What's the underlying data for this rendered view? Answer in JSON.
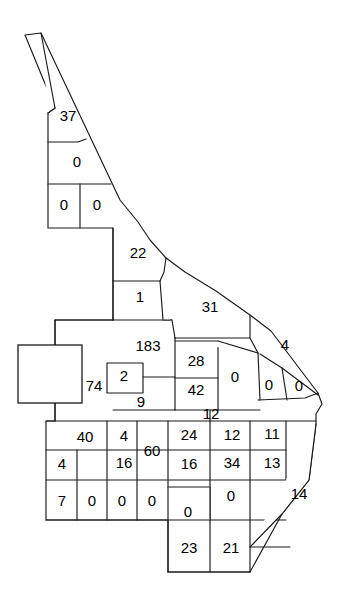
{
  "figure": {
    "type": "choropleth-region-map",
    "background_color": "#ffffff",
    "outline_color": "#1a1a1a",
    "label_color": "#000000",
    "texture_color": "#c9c9c9",
    "width": 362,
    "height": 605
  },
  "regions": [
    {
      "id": "r-37",
      "label": "37",
      "x": 68,
      "y": 117
    },
    {
      "id": "r-0a",
      "label": "0",
      "x": 77,
      "y": 163
    },
    {
      "id": "r-0b",
      "label": "0",
      "x": 64,
      "y": 206
    },
    {
      "id": "r-0c",
      "label": "0",
      "x": 97,
      "y": 206
    },
    {
      "id": "r-22",
      "label": "22",
      "x": 138,
      "y": 254
    },
    {
      "id": "r-1",
      "label": "1",
      "x": 140,
      "y": 298
    },
    {
      "id": "r-31",
      "label": "31",
      "x": 210,
      "y": 308
    },
    {
      "id": "r-183",
      "label": "183",
      "x": 148,
      "y": 347
    },
    {
      "id": "r-4r",
      "label": "4",
      "x": 285,
      "y": 346
    },
    {
      "id": "r-28",
      "label": "28",
      "x": 196,
      "y": 362
    },
    {
      "id": "r-0d",
      "label": "0",
      "x": 235,
      "y": 378
    },
    {
      "id": "r-74",
      "label": "74",
      "x": 94,
      "y": 387
    },
    {
      "id": "r-2",
      "label": "2",
      "x": 124,
      "y": 377
    },
    {
      "id": "r-42",
      "label": "42",
      "x": 196,
      "y": 391
    },
    {
      "id": "r-0e",
      "label": "0",
      "x": 269,
      "y": 386
    },
    {
      "id": "r-0f",
      "label": "0",
      "x": 299,
      "y": 387
    },
    {
      "id": "r-9",
      "label": "9",
      "x": 141,
      "y": 403
    },
    {
      "id": "r-12a",
      "label": "12",
      "x": 211,
      "y": 415
    },
    {
      "id": "r-40",
      "label": "40",
      "x": 85,
      "y": 438
    },
    {
      "id": "r-4a",
      "label": "4",
      "x": 124,
      "y": 437
    },
    {
      "id": "r-24",
      "label": "24",
      "x": 189,
      "y": 436
    },
    {
      "id": "r-12b",
      "label": "12",
      "x": 232,
      "y": 436
    },
    {
      "id": "r-11",
      "label": "11",
      "x": 272,
      "y": 435
    },
    {
      "id": "r-60",
      "label": "60",
      "x": 152,
      "y": 452
    },
    {
      "id": "r-4b",
      "label": "4",
      "x": 62,
      "y": 465
    },
    {
      "id": "r-16a",
      "label": "16",
      "x": 124,
      "y": 464
    },
    {
      "id": "r-16b",
      "label": "16",
      "x": 189,
      "y": 465
    },
    {
      "id": "r-34",
      "label": "34",
      "x": 232,
      "y": 464
    },
    {
      "id": "r-13",
      "label": "13",
      "x": 272,
      "y": 464
    },
    {
      "id": "r-7",
      "label": "7",
      "x": 62,
      "y": 502
    },
    {
      "id": "r-0g",
      "label": "0",
      "x": 92,
      "y": 502
    },
    {
      "id": "r-0h",
      "label": "0",
      "x": 122,
      "y": 502
    },
    {
      "id": "r-0i",
      "label": "0",
      "x": 152,
      "y": 502
    },
    {
      "id": "r-0j",
      "label": "0",
      "x": 188,
      "y": 513
    },
    {
      "id": "r-0k",
      "label": "0",
      "x": 231,
      "y": 497
    },
    {
      "id": "r-14",
      "label": "14",
      "x": 299,
      "y": 495
    },
    {
      "id": "r-23",
      "label": "23",
      "x": 189,
      "y": 549
    },
    {
      "id": "r-21",
      "label": "21",
      "x": 231,
      "y": 549
    }
  ],
  "region_outlines": [
    {
      "id": "o-sliver",
      "d": "M 25 35 L 41 33 L 55 108 L 48 113 Z"
    },
    {
      "id": "o-37",
      "d": "M 48 113 L 87 113 L 86 139 L 78 142 L 55 142 L 55 108 Z"
    },
    {
      "id": "o-0a",
      "d": "M 55 142 L 78 142 L 86 139 L 111 184 L 48 184 L 48 142 Z"
    },
    {
      "id": "o-0b",
      "d": "M 48 184 L 80 184 L 80 228 L 48 228 Z"
    },
    {
      "id": "o-0c",
      "d": "M 80 184 L 111 184 L 114 188 L 113 228 L 80 228 Z"
    },
    {
      "id": "o-22",
      "d": "M 113 228 L 114 188 L 130 213 L 152 243 L 165 257 L 164 272 L 160 281 L 113 281 Z"
    },
    {
      "id": "o-1",
      "d": "M 113 281 L 160 281 L 163 320 L 113 320 Z"
    },
    {
      "id": "o-31",
      "d": "M 163 320 L 160 281 L 164 272 L 172 262 L 250 315 L 250 338 L 175 338 L 172 320 Z"
    },
    {
      "id": "o-4right",
      "d": "M 250 315 L 271 331 L 318 393 L 305 396 L 260 396 L 258 353 L 250 338 Z"
    },
    {
      "id": "o-183",
      "d": "M 113 320 L 172 320 L 175 338 L 175 410 L 113 410 Z"
    },
    {
      "id": "o-74",
      "d": "M 55 320 L 113 320 L 113 410 L 55 410 Z"
    },
    {
      "id": "o-2box",
      "d": "M 107 363 L 143 363 L 143 393 L 107 393 Z"
    },
    {
      "id": "o-28",
      "d": "M 175 338 L 218 341 L 218 378 L 175 378 Z"
    },
    {
      "id": "o-42",
      "d": "M 175 378 L 218 378 L 218 410 L 175 410 Z"
    },
    {
      "id": "o-0d",
      "d": "M 218 341 L 258 353 L 260 396 L 218 410 Z"
    },
    {
      "id": "o-0e",
      "d": "M 260 353 L 282 368 L 287 400 L 258 400 Z"
    },
    {
      "id": "o-0f",
      "d": "M 282 368 L 318 395 L 287 400 Z"
    },
    {
      "id": "o-grid1",
      "d": "M 46 421 L 316 421"
    },
    {
      "id": "o-grid2",
      "d": "M 46 450 L 316 450"
    },
    {
      "id": "o-grid3",
      "d": "M 46 480 L 316 480"
    },
    {
      "id": "o-grid4",
      "d": "M 46 520 L 310 520"
    },
    {
      "id": "o-grid5",
      "d": "M 168 572 L 250 572"
    },
    {
      "id": "o-left",
      "d": "M 46 421 L 46 520"
    }
  ],
  "texture_patches": [
    {
      "x": 55,
      "y": 321,
      "w": 4,
      "h": 5
    },
    {
      "x": 62,
      "y": 322,
      "w": 2,
      "h": 6
    },
    {
      "x": 83,
      "y": 322,
      "w": 3,
      "h": 3
    },
    {
      "x": 90,
      "y": 320,
      "w": 2,
      "h": 8
    },
    {
      "x": 96,
      "y": 323,
      "w": 4,
      "h": 3
    },
    {
      "x": 55,
      "y": 334,
      "w": 8,
      "h": 3
    },
    {
      "x": 66,
      "y": 335,
      "w": 3,
      "h": 3
    },
    {
      "x": 74,
      "y": 334,
      "w": 2,
      "h": 4
    },
    {
      "x": 80,
      "y": 333,
      "w": 3,
      "h": 5
    },
    {
      "x": 86,
      "y": 336,
      "w": 5,
      "h": 2
    },
    {
      "x": 128,
      "y": 322,
      "w": 6,
      "h": 4
    },
    {
      "x": 137,
      "y": 321,
      "w": 3,
      "h": 6
    },
    {
      "x": 146,
      "y": 324,
      "w": 4,
      "h": 3
    },
    {
      "x": 130,
      "y": 330,
      "w": 7,
      "h": 5
    },
    {
      "x": 140,
      "y": 331,
      "w": 14,
      "h": 6
    },
    {
      "x": 156,
      "y": 333,
      "w": 8,
      "h": 4
    },
    {
      "x": 166,
      "y": 330,
      "w": 5,
      "h": 7
    },
    {
      "x": 122,
      "y": 371,
      "w": 12,
      "h": 4
    },
    {
      "x": 122,
      "y": 375,
      "w": 3,
      "h": 7
    },
    {
      "x": 146,
      "y": 345,
      "w": 3,
      "h": 4
    },
    {
      "x": 154,
      "y": 352,
      "w": 5,
      "h": 3
    },
    {
      "x": 146,
      "y": 362,
      "w": 4,
      "h": 3
    },
    {
      "x": 158,
      "y": 366,
      "w": 5,
      "h": 4
    },
    {
      "x": 148,
      "y": 374,
      "w": 3,
      "h": 5
    },
    {
      "x": 160,
      "y": 379,
      "w": 7,
      "h": 5
    },
    {
      "x": 165,
      "y": 386,
      "w": 5,
      "h": 6
    },
    {
      "x": 172,
      "y": 390,
      "w": 4,
      "h": 4
    },
    {
      "x": 178,
      "y": 380,
      "w": 8,
      "h": 6
    },
    {
      "x": 180,
      "y": 392,
      "w": 5,
      "h": 4
    },
    {
      "x": 188,
      "y": 346,
      "w": 6,
      "h": 4
    },
    {
      "x": 198,
      "y": 343,
      "w": 4,
      "h": 5
    },
    {
      "x": 206,
      "y": 347,
      "w": 7,
      "h": 4
    },
    {
      "x": 180,
      "y": 355,
      "w": 4,
      "h": 3
    },
    {
      "x": 186,
      "y": 368,
      "w": 3,
      "h": 4
    },
    {
      "x": 192,
      "y": 372,
      "w": 5,
      "h": 3
    },
    {
      "x": 176,
      "y": 400,
      "w": 12,
      "h": 3
    },
    {
      "x": 176,
      "y": 406,
      "w": 6,
      "h": 3
    },
    {
      "x": 192,
      "y": 404,
      "w": 7,
      "h": 3
    },
    {
      "x": 222,
      "y": 398,
      "w": 5,
      "h": 3
    },
    {
      "x": 238,
      "y": 400,
      "w": 6,
      "h": 3
    },
    {
      "x": 262,
      "y": 402,
      "w": 5,
      "h": 3
    },
    {
      "x": 278,
      "y": 403,
      "w": 7,
      "h": 3
    },
    {
      "x": 48,
      "y": 423,
      "w": 6,
      "h": 3
    },
    {
      "x": 56,
      "y": 430,
      "w": 3,
      "h": 3
    },
    {
      "x": 57,
      "y": 451,
      "w": 4,
      "h": 3
    },
    {
      "x": 74,
      "y": 456,
      "w": 3,
      "h": 3
    },
    {
      "x": 84,
      "y": 472,
      "w": 9,
      "h": 4
    },
    {
      "x": 96,
      "y": 470,
      "w": 6,
      "h": 5
    },
    {
      "x": 104,
      "y": 423,
      "w": 3,
      "h": 4
    },
    {
      "x": 106,
      "y": 443,
      "w": 4,
      "h": 3
    },
    {
      "x": 132,
      "y": 432,
      "w": 3,
      "h": 3
    },
    {
      "x": 138,
      "y": 424,
      "w": 5,
      "h": 4
    },
    {
      "x": 144,
      "y": 435,
      "w": 4,
      "h": 5
    },
    {
      "x": 142,
      "y": 460,
      "w": 3,
      "h": 4
    },
    {
      "x": 156,
      "y": 466,
      "w": 5,
      "h": 3
    },
    {
      "x": 160,
      "y": 425,
      "w": 4,
      "h": 4
    },
    {
      "x": 168,
      "y": 424,
      "w": 3,
      "h": 4
    },
    {
      "x": 172,
      "y": 432,
      "w": 5,
      "h": 3
    },
    {
      "x": 176,
      "y": 440,
      "w": 3,
      "h": 3
    },
    {
      "x": 196,
      "y": 425,
      "w": 4,
      "h": 3
    },
    {
      "x": 206,
      "y": 423,
      "w": 3,
      "h": 5
    },
    {
      "x": 212,
      "y": 428,
      "w": 5,
      "h": 3
    },
    {
      "x": 220,
      "y": 452,
      "w": 4,
      "h": 5
    },
    {
      "x": 236,
      "y": 452,
      "w": 8,
      "h": 5
    },
    {
      "x": 246,
      "y": 428,
      "w": 3,
      "h": 4
    },
    {
      "x": 252,
      "y": 424,
      "w": 4,
      "h": 4
    },
    {
      "x": 258,
      "y": 452,
      "w": 4,
      "h": 3
    },
    {
      "x": 286,
      "y": 432,
      "w": 3,
      "h": 4
    },
    {
      "x": 290,
      "y": 444,
      "w": 5,
      "h": 3
    },
    {
      "x": 286,
      "y": 460,
      "w": 6,
      "h": 4
    },
    {
      "x": 288,
      "y": 476,
      "w": 3,
      "h": 4
    },
    {
      "x": 168,
      "y": 525,
      "w": 6,
      "h": 3
    },
    {
      "x": 178,
      "y": 523,
      "w": 3,
      "h": 4
    },
    {
      "x": 192,
      "y": 524,
      "w": 3,
      "h": 4
    },
    {
      "x": 168,
      "y": 540,
      "w": 5,
      "h": 3
    },
    {
      "x": 168,
      "y": 552,
      "w": 4,
      "h": 3
    },
    {
      "x": 168,
      "y": 560,
      "w": 4,
      "h": 3
    },
    {
      "x": 212,
      "y": 525,
      "w": 4,
      "h": 3
    },
    {
      "x": 222,
      "y": 523,
      "w": 3,
      "h": 5
    },
    {
      "x": 240,
      "y": 526,
      "w": 5,
      "h": 3
    },
    {
      "x": 212,
      "y": 545,
      "w": 3,
      "h": 4
    },
    {
      "x": 242,
      "y": 562,
      "w": 4,
      "h": 4
    },
    {
      "x": 60,
      "y": 127,
      "w": 18,
      "h": 7
    },
    {
      "x": 118,
      "y": 232,
      "w": 9,
      "h": 8
    },
    {
      "x": 200,
      "y": 312,
      "w": 4,
      "h": 4
    },
    {
      "x": 146,
      "y": 312,
      "w": 3,
      "h": 3
    },
    {
      "x": 126,
      "y": 306,
      "w": 3,
      "h": 3
    },
    {
      "x": 258,
      "y": 424,
      "w": 3,
      "h": 3
    },
    {
      "x": 50,
      "y": 471,
      "w": 5,
      "h": 3
    }
  ],
  "overlay_box": {
    "x": 18,
    "y": 345,
    "w": 64,
    "h": 58
  }
}
